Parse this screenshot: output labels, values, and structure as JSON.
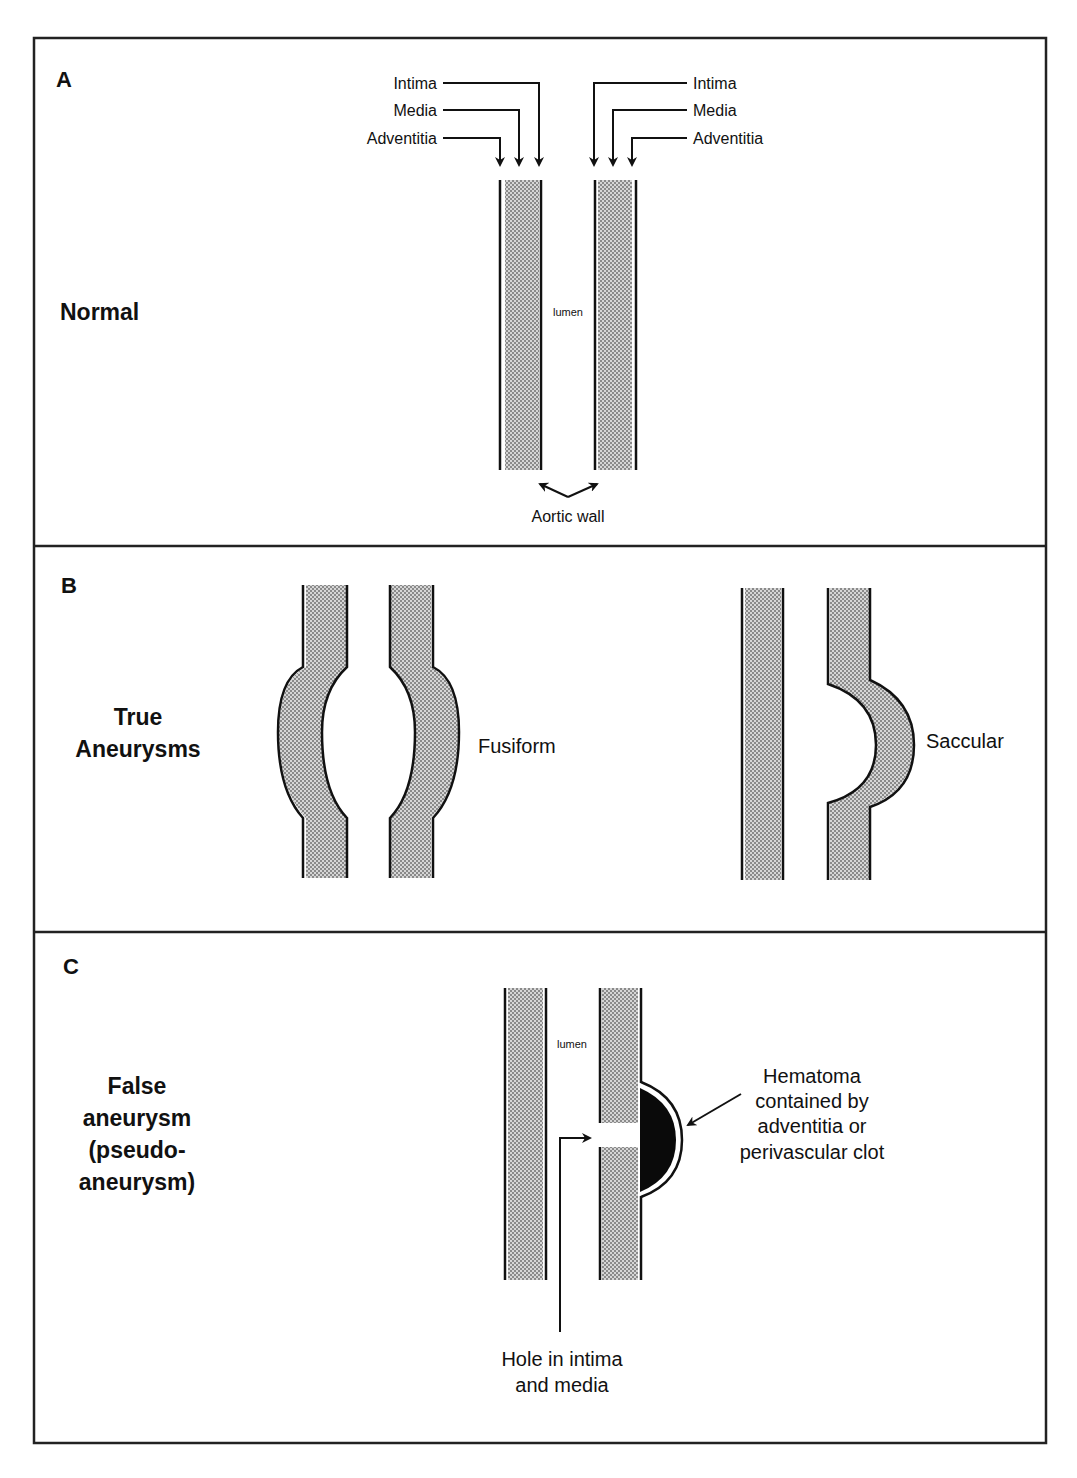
{
  "colors": {
    "line": "#111111",
    "stipple": "#b8b8b8",
    "hematoma": "#0a0a0a",
    "background": "#ffffff"
  },
  "panels": [
    {
      "letter": "A",
      "title": "Normal",
      "labels_left": [
        "Intima",
        "Media",
        "Adventitia"
      ],
      "labels_right": [
        "Intima",
        "Media",
        "Adventitia"
      ],
      "lumen_label": "lumen",
      "wall_label": "Aortic wall"
    },
    {
      "letter": "B",
      "title_lines": [
        "True",
        "Aneurysms"
      ],
      "fusiform_label": "Fusiform",
      "saccular_label": "Saccular"
    },
    {
      "letter": "C",
      "title_lines": [
        "False",
        "aneurysm",
        "(pseudo-",
        "aneurysm)"
      ],
      "lumen_label": "lumen",
      "hematoma_lines": [
        "Hematoma",
        "contained by",
        "adventitia or",
        "perivascular clot"
      ],
      "hole_lines": [
        "Hole in intima",
        "and media"
      ]
    }
  ]
}
